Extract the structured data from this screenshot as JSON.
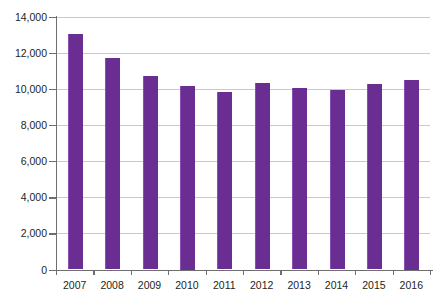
{
  "chart_data": {
    "type": "bar",
    "title": "",
    "subtitle": "",
    "xlabel": "",
    "ylabel": "",
    "categories": [
      "2007",
      "2008",
      "2009",
      "2010",
      "2011",
      "2012",
      "2013",
      "2014",
      "2015",
      "2016"
    ],
    "values": [
      13050,
      11720,
      10750,
      10150,
      9830,
      10330,
      10070,
      9930,
      10300,
      10500
    ],
    "series": [
      {
        "name": "",
        "values": [
          13050,
          11720,
          10750,
          10150,
          9830,
          10330,
          10070,
          9930,
          10300,
          10500
        ]
      }
    ],
    "ylim": [
      0,
      14000
    ],
    "ytick_values": [
      0,
      2000,
      4000,
      6000,
      8000,
      10000,
      12000,
      14000
    ],
    "ytick_labels": [
      "0",
      "2,000",
      "4,000",
      "6,000",
      "8,000",
      "10,000",
      "12,000",
      "14,000"
    ],
    "grid": true,
    "grid_axis": "y",
    "legend": false,
    "legend_position": "none",
    "bar_color": "#6a2d91",
    "grid_color": "#c9c9c9",
    "axis_color": "#6e6e6e",
    "text_color": "#231f20",
    "background_color": "#ffffff"
  }
}
